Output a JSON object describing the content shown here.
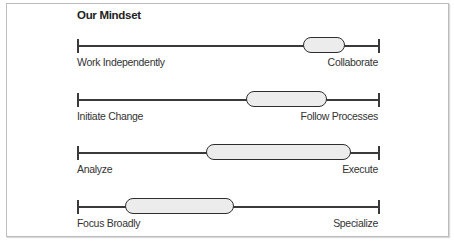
{
  "title": "Our Mindset",
  "scales": [
    {
      "left": "Work Independently",
      "right": "Collaborate",
      "pill_start": 0.75,
      "pill_end": 0.89,
      "y": 45
    },
    {
      "left": "Initiate Change",
      "right": "Follow Processes",
      "pill_start": 0.56,
      "pill_end": 0.83,
      "y": 99
    },
    {
      "left": "Analyze",
      "right": "Execute",
      "pill_start": 0.43,
      "pill_end": 0.91,
      "y": 152
    },
    {
      "left": "Focus Broadly",
      "right": "Specialize",
      "pill_start": 0.16,
      "pill_end": 0.52,
      "y": 206
    }
  ],
  "colors": {
    "line": "#3a3a3a",
    "pill_fill": "#ececec",
    "pill_border": "#2e2e2e"
  }
}
